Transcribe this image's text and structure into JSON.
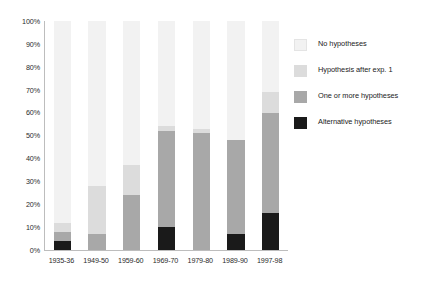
{
  "chart_data": {
    "type": "bar",
    "stacked": true,
    "stack_mode": "percent",
    "title": "",
    "subtitle": "",
    "xlabel": "",
    "ylabel": "",
    "ylim": [
      0,
      100
    ],
    "yticks": [
      "0%",
      "10%",
      "20%",
      "30%",
      "40%",
      "50%",
      "60%",
      "70%",
      "80%",
      "90%",
      "100%"
    ],
    "ytick_values": [
      0,
      10,
      20,
      30,
      40,
      50,
      60,
      70,
      80,
      90,
      100
    ],
    "grid": true,
    "grid_axis": "y",
    "legend_position": "right",
    "categories": [
      "1935-36",
      "1949-50",
      "1959-60",
      "1969-70",
      "1979-80",
      "1989-90",
      "1997-98"
    ],
    "series": [
      {
        "name": "Alternative hypotheses",
        "color": "#1a1a1a",
        "stack_order": 0,
        "values": [
          4,
          0,
          0,
          10,
          0,
          7,
          16
        ]
      },
      {
        "name": "One or more hypotheses",
        "color": "#a8a8a8",
        "stack_order": 1,
        "values": [
          4,
          7,
          24,
          42,
          51,
          41,
          44
        ]
      },
      {
        "name": "Hypothesis after exp. 1",
        "color": "#dcdcdc",
        "stack_order": 2,
        "values": [
          4,
          21,
          13,
          2,
          2,
          0,
          9
        ]
      },
      {
        "name": "No hypotheses",
        "color": "#f2f2f2",
        "stack_order": 3,
        "values": [
          88,
          72,
          63,
          46,
          47,
          52,
          31
        ]
      }
    ],
    "cumulative_tops": {
      "1935-36": [
        4,
        8,
        12,
        100
      ],
      "1949-50": [
        0,
        7,
        28,
        100
      ],
      "1959-60": [
        0,
        24,
        37,
        100
      ],
      "1969-70": [
        10,
        52,
        54,
        100
      ],
      "1979-80": [
        0,
        51,
        53,
        100
      ],
      "1989-90": [
        7,
        48,
        48,
        100
      ],
      "1997-98": [
        16,
        60,
        69,
        100
      ]
    }
  },
  "legend": {
    "items": [
      {
        "label": "No hypotheses",
        "color": "#f2f2f2"
      },
      {
        "label": "Hypothesis after exp. 1",
        "color": "#dcdcdc"
      },
      {
        "label": "One or more hypotheses",
        "color": "#a8a8a8"
      },
      {
        "label": "Alternative hypotheses",
        "color": "#1a1a1a"
      }
    ]
  },
  "axis": {
    "y_labels": [
      "100%",
      "90%",
      "80%",
      "70%",
      "60%",
      "50%",
      "40%",
      "30%",
      "20%",
      "10%",
      "0%"
    ],
    "x_labels": [
      "1935-36",
      "1949-50",
      "1959-60",
      "1969-70",
      "1979-80",
      "1989-90",
      "1997-98"
    ]
  },
  "colors": {
    "axis_line": "#bdbdbd",
    "gridline": "#ffffff",
    "plot_background": "#f2f2f2",
    "text": "#2b2b2b"
  }
}
